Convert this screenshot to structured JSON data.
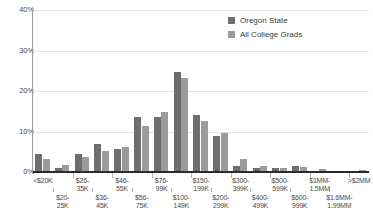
{
  "chart_data": {
    "type": "bar",
    "title": "",
    "xlabel": "",
    "ylabel": "",
    "ylim": [
      0,
      40
    ],
    "grid": true,
    "legend_position": "top-right",
    "ytick_labels": [
      "40%",
      "30%",
      "20%",
      "10%",
      "0%"
    ],
    "ytick_values": [
      40,
      30,
      20,
      10,
      0
    ],
    "categories": [
      "<$20K",
      "$20-25K",
      "$26-35K",
      "$36-45K",
      "$46-55K",
      "$56-75K",
      "$76-99K",
      "$100-149K",
      "$150-199K",
      "$200-299K",
      "$300-399K",
      "$400-499K",
      "$500-599K",
      "$600-999K",
      "$1MM-1.5MM",
      "$1.6MM-1.99MM",
      ">$2MM"
    ],
    "category_lines": [
      [
        "<$20K",
        ""
      ],
      [
        "$20-",
        "25K"
      ],
      [
        "$26-",
        "35K"
      ],
      [
        "$36-",
        "45K"
      ],
      [
        "$46-",
        "55K"
      ],
      [
        "$56-",
        "75K"
      ],
      [
        "$76-",
        "99K"
      ],
      [
        "$100-",
        "149K"
      ],
      [
        "$150-",
        "199K"
      ],
      [
        "$200-",
        "299K"
      ],
      [
        "$300-",
        "399K"
      ],
      [
        "$400-",
        "499K"
      ],
      [
        "$500-",
        "599K"
      ],
      [
        "$600-",
        "999K"
      ],
      [
        "$1MM-",
        "1.5MM"
      ],
      [
        "$1.6MM-",
        "1.99MM"
      ],
      [
        ">$2MM",
        ""
      ]
    ],
    "series": [
      {
        "name": "Oregon State",
        "color": "#6e6e6e",
        "values": [
          4.5,
          1.1,
          4.5,
          7.0,
          5.8,
          13.7,
          13.7,
          24.6,
          14.0,
          9.0,
          1.5,
          1.0,
          0.9,
          1.4,
          0.3,
          0.2,
          0.2
        ]
      },
      {
        "name": "All College Grads",
        "color": "#9b9b9b",
        "values": [
          3.1,
          1.8,
          3.7,
          5.1,
          6.1,
          11.3,
          14.8,
          23.1,
          12.5,
          9.7,
          3.1,
          1.4,
          1.1,
          1.2,
          0.8,
          0.3,
          0.6
        ]
      }
    ]
  },
  "legend": {
    "items": [
      {
        "label": "Oregon State",
        "color": "#6e6e6e"
      },
      {
        "label": "All College Grads",
        "color": "#9b9b9b"
      }
    ]
  },
  "colors": {
    "series_dark": "#6e6e6e",
    "series_light": "#9b9b9b",
    "gridline": "#e3e3e3",
    "axis": "#2b2b2b",
    "text": "#4a4a4a",
    "background": "#ffffff"
  }
}
